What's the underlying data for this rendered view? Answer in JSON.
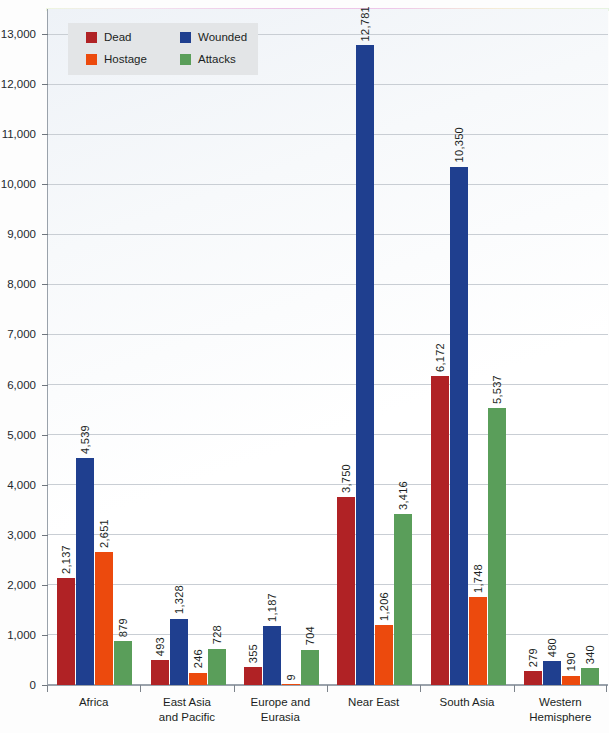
{
  "chart_data": {
    "type": "bar",
    "title": "",
    "subtitle": "",
    "xlabel": "",
    "ylabel": "",
    "ylim": [
      0,
      13500
    ],
    "grid": true,
    "legend_position": "top-left",
    "categories": [
      "Africa",
      "East Asia and Pacific",
      "Europe and Eurasia",
      "Near East",
      "South Asia",
      "Western Hemisphere"
    ],
    "category_lines": [
      [
        "Africa"
      ],
      [
        "East Asia",
        "and Pacific"
      ],
      [
        "Europe and",
        "Eurasia"
      ],
      [
        "Near East"
      ],
      [
        "South Asia"
      ],
      [
        "Western",
        "Hemisphere"
      ]
    ],
    "series": [
      {
        "name": "Dead",
        "color": "#b02225",
        "values": [
          2137,
          493,
          355,
          3750,
          6172,
          279
        ],
        "labels": [
          "2,137",
          "493",
          "355",
          "3,750",
          "6,172",
          "279"
        ]
      },
      {
        "name": "Wounded",
        "color": "#1f3f8f",
        "values": [
          4539,
          1328,
          1187,
          12781,
          10350,
          480
        ],
        "labels": [
          "4,539",
          "1,328",
          "1,187",
          "12,781",
          "10,350",
          "480"
        ]
      },
      {
        "name": "Hostage",
        "color": "#ec4a0d",
        "values": [
          2651,
          246,
          9,
          1206,
          1748,
          190
        ],
        "labels": [
          "2,651",
          "246",
          "9",
          "1,206",
          "1,748",
          "190"
        ]
      },
      {
        "name": "Attacks",
        "color": "#5a9e5a",
        "values": [
          879,
          728,
          704,
          3416,
          5537,
          340
        ],
        "labels": [
          "879",
          "728",
          "704",
          "3,416",
          "5,537",
          "340"
        ]
      }
    ],
    "y_ticks": [
      0,
      1000,
      2000,
      3000,
      4000,
      5000,
      6000,
      7000,
      8000,
      9000,
      10000,
      11000,
      12000,
      13000
    ],
    "y_tick_labels": [
      "0",
      "1,000",
      "2,000",
      "3,000",
      "4,000",
      "5,000",
      "6,000",
      "7,000",
      "8,000",
      "9,000",
      "10,000",
      "11,000",
      "12,000",
      "13,000"
    ]
  },
  "legend": {
    "items": [
      {
        "label": "Dead",
        "color": "#b02225"
      },
      {
        "label": "Wounded",
        "color": "#1f3f8f"
      },
      {
        "label": "Hostage",
        "color": "#ec4a0d"
      },
      {
        "label": "Attacks",
        "color": "#5a9e5a"
      }
    ]
  }
}
